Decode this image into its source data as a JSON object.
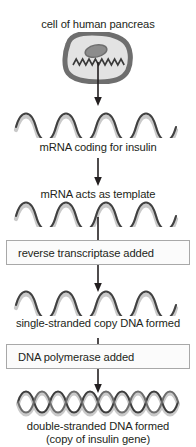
{
  "diagram": {
    "title": "cell of human pancreas",
    "width": 196,
    "height": 447,
    "background_color": "#ffffff",
    "text_color": "#231f20"
  },
  "cell": {
    "label": "cell of human pancreas",
    "membrane_color": "#6e6e6e",
    "cytoplasm_color": "#e2e2e2",
    "nucleus_color": "#8c8c8c",
    "mrna_squiggle_color": "#3a3a3a"
  },
  "steps": [
    {
      "id": "mrna-coding",
      "graphic": "single-strand-helix",
      "label": "mRNA coding for insulin"
    },
    {
      "id": "mrna-template",
      "graphic": "single-strand-helix",
      "label": "mRNA acts as template"
    },
    {
      "id": "reverse-transcriptase",
      "graphic": "process-box",
      "label": "reverse transcriptase added"
    },
    {
      "id": "single-stranded-copy",
      "graphic": "single-strand-helix",
      "label": "single-stranded copy DNA formed"
    },
    {
      "id": "dna-polymerase",
      "graphic": "process-box",
      "label": "DNA polymerase added"
    },
    {
      "id": "double-stranded-dna",
      "graphic": "double-strand-helix",
      "label": "double-stranded DNA formed",
      "sublabel": "(copy of insulin gene)"
    }
  ],
  "arrows": {
    "count": 5,
    "color": "#231f20",
    "direction": "down"
  },
  "helix": {
    "strand_light_color": "#cfcfcf",
    "strand_dark_color": "#3f3f3f",
    "peak_count": 6
  }
}
